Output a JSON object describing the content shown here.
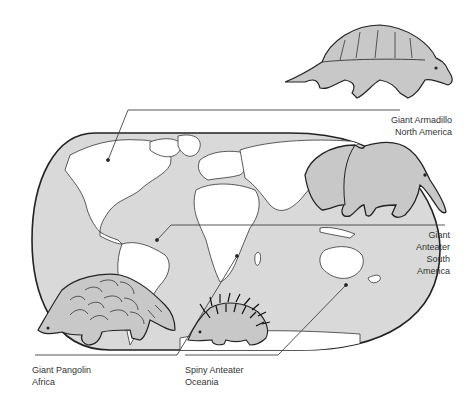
{
  "diagram": {
    "type": "illustrated world map with animal callouts",
    "colors": {
      "ocean": "#d9d9d9",
      "land": "#ffffff",
      "animal_fill": "#c8c8c8",
      "outline": "#222222",
      "leader_line": "#444444",
      "text": "#333333"
    },
    "callouts": [
      {
        "id": "armadillo",
        "name": "Giant Armadillo",
        "region": "North America",
        "icon": "armadillo-illustration"
      },
      {
        "id": "anteater",
        "name_line1": "Giant",
        "name_line2": "Anteater",
        "region_line1": "South",
        "region_line2": "America",
        "icon": "giant-anteater-illustration"
      },
      {
        "id": "pangolin",
        "name": "Giant Pangolin",
        "region": "Africa",
        "icon": "pangolin-illustration"
      },
      {
        "id": "echidna",
        "name": "Spiny Anteater",
        "region": "Oceania",
        "icon": "echidna-illustration"
      }
    ]
  }
}
